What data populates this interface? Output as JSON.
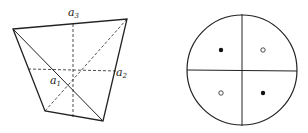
{
  "left_figure": {
    "description": "Tetrahedron-like quadrilateral with three dashed axes",
    "labels": {
      "a1": {
        "base": "a",
        "sub": "1"
      },
      "a2": {
        "base": "a",
        "sub": "2"
      },
      "a3": {
        "base": "a",
        "sub": "3"
      }
    }
  },
  "right_figure": {
    "description": "Circle divided into four quadrants",
    "quadrants": [
      {
        "position": "top-left",
        "marker": "filled-dot"
      },
      {
        "position": "top-right",
        "marker": "open-circle"
      },
      {
        "position": "bottom-left",
        "marker": "open-circle"
      },
      {
        "position": "bottom-right",
        "marker": "filled-dot"
      }
    ]
  },
  "colors": {
    "stroke": "#222222",
    "background": "#ffffff"
  }
}
